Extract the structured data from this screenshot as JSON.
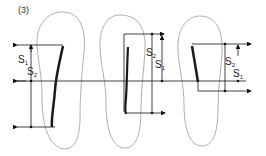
{
  "figure": {
    "panel_label": "(3)",
    "colors": {
      "outline": "#9a9a9a",
      "lines": "#111111",
      "stroke": "#1a1a1a"
    },
    "feet": [
      {
        "id": "left",
        "labels": [
          {
            "base": "S",
            "sub": "1"
          },
          {
            "base": "S",
            "sub": "2"
          }
        ]
      },
      {
        "id": "middle",
        "labels": [
          {
            "base": "S",
            "sub": "2"
          },
          {
            "base": "S",
            "sub": "1"
          }
        ]
      },
      {
        "id": "right",
        "labels": [
          {
            "base": "S",
            "sub": "2"
          },
          {
            "base": "S",
            "sub": "1"
          }
        ]
      }
    ]
  }
}
